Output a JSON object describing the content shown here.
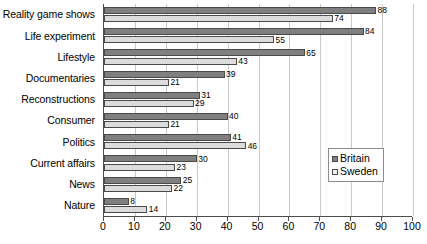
{
  "chart_data": {
    "type": "bar",
    "orientation": "horizontal",
    "title": "",
    "xlabel": "",
    "ylabel": "",
    "xlim": [
      0,
      100
    ],
    "xticks": [
      0,
      10,
      20,
      30,
      40,
      50,
      60,
      70,
      80,
      90,
      100
    ],
    "grid": true,
    "grid_axis": "x",
    "legend_position": "right-center",
    "categories": [
      "Reality game shows",
      "Life experiment",
      "Lifestyle",
      "Documentaries",
      "Reconstructions",
      "Consumer",
      "Politics",
      "Current affairs",
      "News",
      "Nature"
    ],
    "series": [
      {
        "name": "Britain",
        "color": "#7f7f7f",
        "values": [
          88,
          84,
          65,
          39,
          31,
          40,
          41,
          30,
          25,
          8
        ]
      },
      {
        "name": "Sweden",
        "color": "#dcdcdc",
        "values": [
          74,
          55,
          43,
          21,
          29,
          21,
          46,
          23,
          22,
          14
        ]
      }
    ]
  },
  "legend": {
    "items": [
      {
        "label": "Britain",
        "swatch": "britain"
      },
      {
        "label": "Sweden",
        "swatch": "sweden"
      }
    ]
  }
}
